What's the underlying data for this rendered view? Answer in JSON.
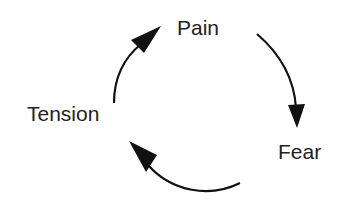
{
  "diagram": {
    "type": "cycle",
    "nodes": [
      {
        "id": "pain",
        "label": "Pain"
      },
      {
        "id": "fear",
        "label": "Fear"
      },
      {
        "id": "tension",
        "label": "Tension"
      }
    ],
    "edges": [
      {
        "from": "pain",
        "to": "fear"
      },
      {
        "from": "fear",
        "to": "tension"
      },
      {
        "from": "tension",
        "to": "pain"
      }
    ],
    "colors": {
      "text": "#222222",
      "arrow": "#111111",
      "background": "#ffffff"
    }
  }
}
